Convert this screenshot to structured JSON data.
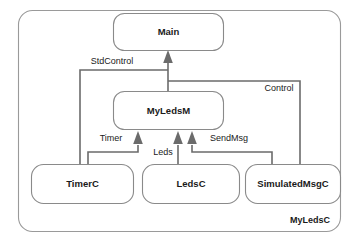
{
  "diagram": {
    "container": {
      "label": "MyLedsC"
    },
    "nodes": [
      {
        "id": "main",
        "label": "Main"
      },
      {
        "id": "myledsm",
        "label": "MyLedsM"
      },
      {
        "id": "timerc",
        "label": "TimerC"
      },
      {
        "id": "ledsc",
        "label": "LedsC"
      },
      {
        "id": "simulatedmsgc",
        "label": "SimulatedMsgC"
      }
    ],
    "edges": [
      {
        "id": "stdcontrol",
        "label": "StdControl",
        "from": "timerc",
        "to": "main"
      },
      {
        "id": "control",
        "label": "Control",
        "from": "simulatedmsgc",
        "to": "main"
      },
      {
        "id": "main-wire",
        "label": "",
        "from": "myledsm",
        "to": "main"
      },
      {
        "id": "timer",
        "label": "Timer",
        "from": "timerc",
        "to": "myledsm"
      },
      {
        "id": "leds",
        "label": "Leds",
        "from": "ledsc",
        "to": "myledsm"
      },
      {
        "id": "sendmsg",
        "label": "SendMsg",
        "from": "simulatedmsgc",
        "to": "myledsm"
      }
    ],
    "colors": {
      "background": "#ffffff",
      "node_stroke": "#8a8a8a",
      "container_stroke": "#9a9a9a",
      "edge": "#6b6b6b",
      "text": "#1a1a1a"
    }
  }
}
